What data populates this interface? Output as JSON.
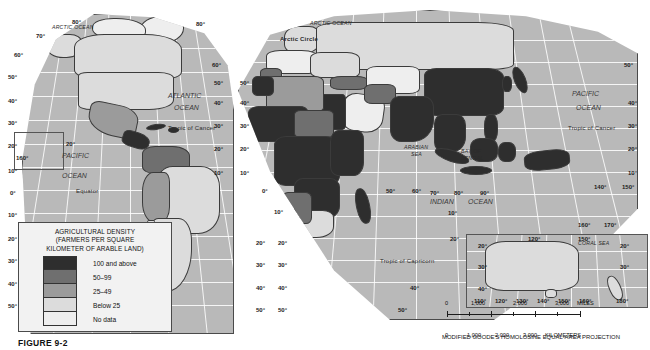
{
  "figure": {
    "caption": "FIGURE 9-2"
  },
  "legend": {
    "title_line1": "AGRICULTURAL DENSITY",
    "title_line2": "(FARMERS PER SQUARE",
    "title_line3": "KILOMETER OF ARABLE LAND)",
    "classes": [
      {
        "label": "100 and above",
        "color": "#2e2e2e"
      },
      {
        "label": "50–99",
        "color": "#6f6f6f"
      },
      {
        "label": "25–49",
        "color": "#9b9b9b"
      },
      {
        "label": "Below 25",
        "color": "#dcdcdc"
      },
      {
        "label": "No data",
        "color": "#eeeeee"
      }
    ]
  },
  "scale": {
    "miles": {
      "ticks": [
        "0",
        "1,000",
        "2,000",
        "3,000"
      ],
      "unit": "MILES"
    },
    "kilometers": {
      "ticks": [
        "0",
        "1,000",
        "2,000",
        "3,000"
      ],
      "unit": "KILOMETERS"
    },
    "projection": "MODIFIED GOODE'S HOMOLOSINE EQUAL-AREA PROJECTION"
  },
  "map": {
    "oceans": [
      {
        "name": "ATLANTIC OCEAN",
        "line1": "ATLANTIC",
        "line2": "OCEAN"
      },
      {
        "name": "PACIFIC OCEAN",
        "line1": "PACIFIC",
        "line2": "OCEAN"
      },
      {
        "name": "INDIAN OCEAN",
        "line1": "INDIAN",
        "line2": "OCEAN"
      },
      {
        "name": "PACIFIC OCEAN RIGHT",
        "line1": "PACIFIC",
        "line2": "OCEAN"
      }
    ],
    "sea_labels": {
      "arctic_ocean_left": "ARCTIC OCEAN",
      "arctic_ocean_right": "ARCTIC OCEAN",
      "arabian_sea_l1": "ARABIAN",
      "arabian_sea_l2": "SEA",
      "bay_of_bengal_l1": "BAY OF",
      "bay_of_bengal_l2": "BENGAL",
      "coral_sea": "CORAL SEA"
    },
    "reference_lines": {
      "arctic_circle": "Arctic Circle",
      "tropic_of_cancer_left": "Tropic of Cancer",
      "tropic_of_cancer_right": "Tropic of Cancer",
      "equator": "Equator",
      "tropic_of_capricorn": "Tropic of Capricorn"
    },
    "latitudes_left_lobe": [
      "80°",
      "70°",
      "60°",
      "50°",
      "40°",
      "30°",
      "20°",
      "10°",
      "0°",
      "10°",
      "20°",
      "30°",
      "40°",
      "50°"
    ],
    "latitudes_left_inner": [
      "80°",
      "60°",
      "50°",
      "40°",
      "30°",
      "20°",
      "10°"
    ],
    "latitudes_right_edge": [
      "50°",
      "40°",
      "30°",
      "20°",
      "10°"
    ],
    "latitudes_south": [
      "20°",
      "30°",
      "40°",
      "50°"
    ],
    "longitudes_equator_row": [
      "0°",
      "50°",
      "60°",
      "70°",
      "80°",
      "90°",
      "140°",
      "150°"
    ],
    "longitude_inset_left": "160°",
    "longitudes_pacific_right": [
      "140°",
      "150°",
      "160°",
      "170°"
    ],
    "australia_inset": {
      "lats": [
        "20°",
        "30°",
        "40°"
      ],
      "lats_right": [
        "20°",
        "30°"
      ],
      "lons": [
        "110°",
        "120°",
        "130°",
        "140°",
        "150°",
        "160°",
        "180°"
      ],
      "lons_top": [
        "120°",
        "150°",
        "160°",
        "170°"
      ]
    }
  },
  "colors": {
    "ocean": "#b9b9b9",
    "frame": "#4a4a4a",
    "graticule": "#ffffff",
    "legend_bg": "#f2f2f2"
  }
}
